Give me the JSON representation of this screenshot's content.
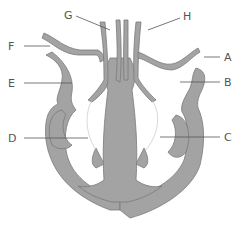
{
  "diagram": {
    "colors": {
      "tissue": "#9e9e9e",
      "outline": "#6e6e6e",
      "label": "#555555",
      "leader": "#555555",
      "background": "#ffffff"
    },
    "labels": [
      {
        "id": "A",
        "text": "A",
        "side": "right"
      },
      {
        "id": "B",
        "text": "B",
        "side": "right"
      },
      {
        "id": "C",
        "text": "C",
        "side": "right"
      },
      {
        "id": "D",
        "text": "D",
        "side": "left"
      },
      {
        "id": "E",
        "text": "E",
        "side": "left"
      },
      {
        "id": "F",
        "text": "F",
        "side": "left"
      },
      {
        "id": "G",
        "text": "G",
        "side": "top"
      },
      {
        "id": "H",
        "text": "H",
        "side": "top"
      }
    ]
  }
}
